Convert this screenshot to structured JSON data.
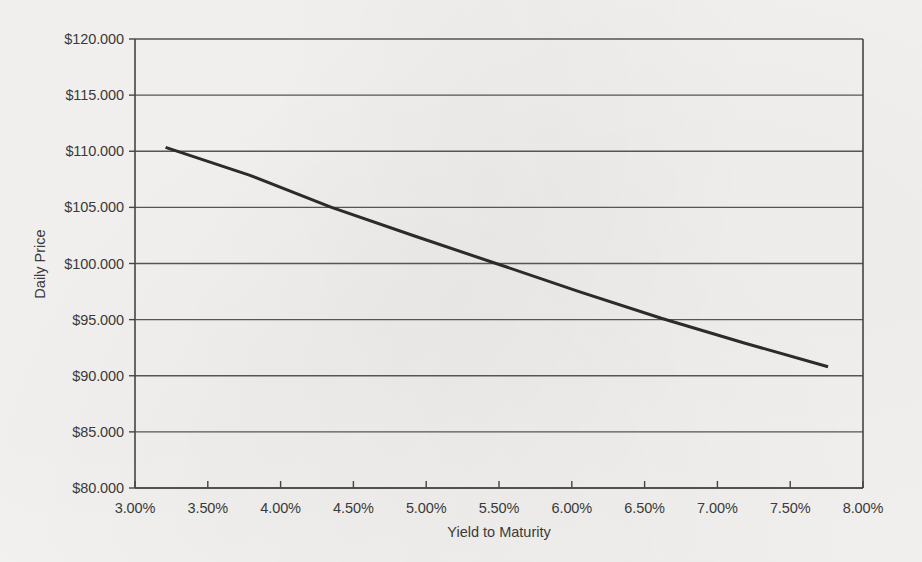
{
  "chart_data": {
    "type": "line",
    "title": "",
    "xlabel": "Yield to Maturity",
    "ylabel": "Daily Price",
    "xlim": [
      3.0,
      8.0
    ],
    "ylim": [
      80.0,
      120.0
    ],
    "grid": "horizontal",
    "legend": "none",
    "x_tick_labels": [
      "3.00%",
      "3.50%",
      "4.00%",
      "4.50%",
      "5.00%",
      "5.50%",
      "6.00%",
      "6.50%",
      "7.00%",
      "7.50%",
      "8.00%"
    ],
    "x_tick_values": [
      3.0,
      3.5,
      4.0,
      4.5,
      5.0,
      5.5,
      6.0,
      6.5,
      7.0,
      7.5,
      8.0
    ],
    "y_tick_labels": [
      "$120.000",
      "$115.000",
      "$110.000",
      "$105.000",
      "$100.000",
      "$95.000",
      "$90.000",
      "$85.000",
      "$80.000"
    ],
    "y_tick_values": [
      120.0,
      115.0,
      110.0,
      105.0,
      100.0,
      95.0,
      90.0,
      85.0,
      80.0
    ],
    "series": [
      {
        "name": "Daily Price",
        "color": "#2b2b2b",
        "line_width": 3,
        "x": [
          3.21,
          3.78,
          4.35,
          4.92,
          5.48,
          6.05,
          6.62,
          7.19,
          7.76
        ],
        "y": [
          110.35,
          107.9,
          105.0,
          102.45,
          100.0,
          97.5,
          95.1,
          92.9,
          90.8
        ]
      }
    ]
  },
  "axes": {
    "y_title": "Daily Price",
    "x_title": "Yield to Maturity"
  },
  "style": {
    "background": "#f6f5f3",
    "axis_color": "#444444",
    "grid_color": "#555555",
    "line_color": "#2b2b2b",
    "text_color": "#3a3a3a"
  }
}
